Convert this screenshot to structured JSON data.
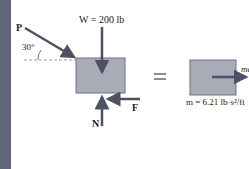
{
  "diagram": {
    "type": "free-body-diagram",
    "left": {
      "force_P_label": "P",
      "angle_label": "30°",
      "weight_label": "W = 200 lb",
      "friction_label": "F",
      "normal_label": "N"
    },
    "equals_sign": "=",
    "right": {
      "accel_label": "ma",
      "mass_label": "m = 6.21 lb·s²/ft"
    },
    "colors": {
      "block_fill": "#a9abb6",
      "block_stroke": "#6f7280",
      "arrow": "#4d5163",
      "side_bar": "#5f6678"
    }
  }
}
